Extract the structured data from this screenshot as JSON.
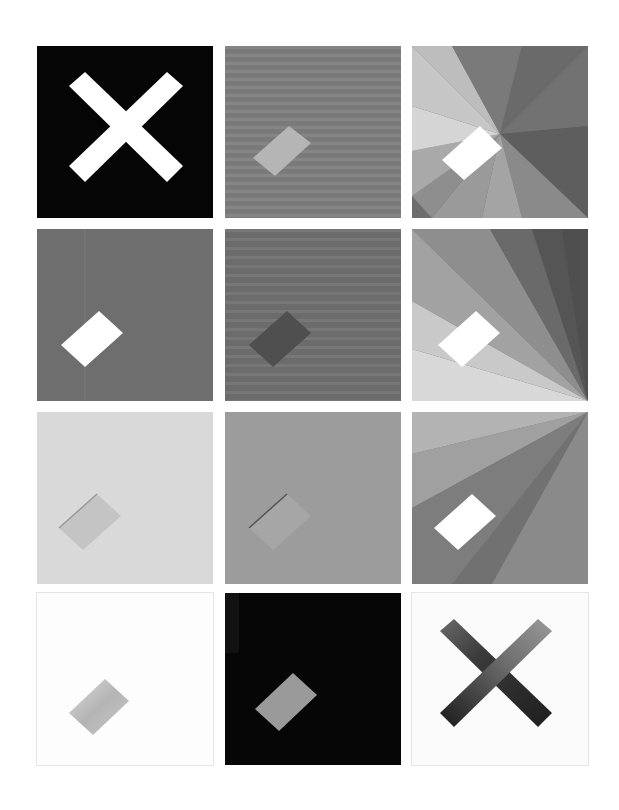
{
  "grid": {
    "rows": 4,
    "columns": 3,
    "background": "#ffffff",
    "tiles": [
      {
        "id": "r1c1",
        "motif": "x-icon",
        "bg": "#050505",
        "shape": "#ffffff"
      },
      {
        "id": "r1c2",
        "motif": "bar-icon",
        "bg": "#7a7a7a",
        "shape": "#b5b5b5"
      },
      {
        "id": "r1c3",
        "motif": "bar-icon",
        "bg": "#8a8a8a",
        "shape": "#ffffff",
        "pattern": "radial-fan"
      },
      {
        "id": "r2c1",
        "motif": "bar-icon",
        "bg": "#6e6e6e",
        "shape": "#ffffff"
      },
      {
        "id": "r2c2",
        "motif": "bar-icon",
        "bg": "#707070",
        "shape": "#4f4f4f"
      },
      {
        "id": "r2c3",
        "motif": "bar-icon",
        "bg": "#9a9a9a",
        "shape": "#ffffff",
        "pattern": "corner-fan-bottom-right"
      },
      {
        "id": "r3c1",
        "motif": "bar-icon",
        "bg": "#d7d7d7",
        "shape": "#c4c4c4"
      },
      {
        "id": "r3c2",
        "motif": "bar-icon",
        "bg": "#9c9c9c",
        "shape": "#a5a5a5"
      },
      {
        "id": "r3c3",
        "motif": "bar-icon",
        "bg": "#8c8c8c",
        "shape": "#ffffff",
        "pattern": "corner-fan-top-right"
      },
      {
        "id": "r4c1",
        "motif": "bar-icon",
        "bg": "#fdfdfd",
        "shape": "#bdbdbd"
      },
      {
        "id": "r4c2",
        "motif": "bar-icon",
        "bg": "#060606",
        "shape": "#9a9a9a"
      },
      {
        "id": "r4c3",
        "motif": "x-icon",
        "bg": "#fbfbfb",
        "shape": "#3c3c3c"
      }
    ]
  }
}
